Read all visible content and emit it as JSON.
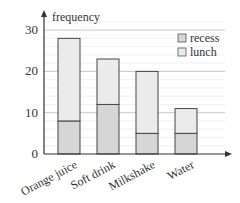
{
  "chart_data": {
    "type": "bar",
    "stacked": true,
    "title": "",
    "xlabel": "",
    "ylabel": "frequency",
    "categories": [
      "Orange juice",
      "Soft drink",
      "Milkshake",
      "Water"
    ],
    "series": [
      {
        "name": "recess",
        "values": [
          8,
          12,
          5,
          5
        ],
        "color": "#d6d6d6"
      },
      {
        "name": "lunch",
        "values": [
          20,
          11,
          15,
          6
        ],
        "color": "#ebebeb"
      }
    ],
    "totals": [
      28,
      23,
      20,
      11
    ],
    "yticks": [
      0,
      10,
      20,
      30
    ],
    "ylim": [
      0,
      32
    ],
    "grid": true,
    "minor_grid_step": 2,
    "legend_position": "top-right"
  },
  "labels": {
    "ylabel": "frequency",
    "yticks": [
      "0",
      "10",
      "20",
      "30"
    ],
    "categories": [
      "Orange juice",
      "Soft drink",
      "Milkshake",
      "Water"
    ],
    "legend": [
      "recess",
      "lunch"
    ]
  }
}
